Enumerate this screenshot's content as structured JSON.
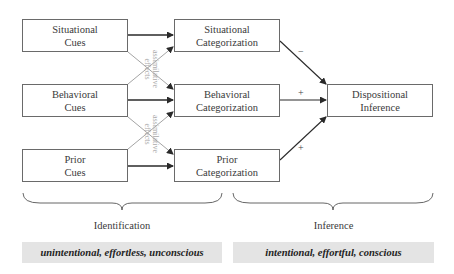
{
  "boxes": {
    "situational_cues": {
      "line1": "Situational",
      "line2": "Cues"
    },
    "behavioral_cues": {
      "line1": "Behavioral",
      "line2": "Cues"
    },
    "prior_cues": {
      "line1": "Prior",
      "line2": "Cues"
    },
    "situational_categorization": {
      "line1": "Situational",
      "line2": "Categorization"
    },
    "behavioral_categorization": {
      "line1": "Behavioral",
      "line2": "Categorization"
    },
    "prior_categorization": {
      "line1": "Prior",
      "line2": "Categorization"
    },
    "dispositional_inference": {
      "line1": "Dispositional",
      "line2": "Inference"
    }
  },
  "cross_labels": {
    "upper": {
      "line1": "assimilative",
      "line2": "effects"
    },
    "lower": {
      "line1": "assimilative",
      "line2": "effects"
    }
  },
  "signs": {
    "situational": "−",
    "behavioral": "+",
    "prior": "+"
  },
  "phases": {
    "identification": {
      "label": "Identification",
      "description": "unintentional, effortless, unconscious"
    },
    "inference": {
      "label": "Inference",
      "description": "intentional, effortful, conscious"
    }
  },
  "colors": {
    "line": "#3a3a3a",
    "cross_line": "#9a9a9a",
    "band": "#e4e4e4"
  }
}
